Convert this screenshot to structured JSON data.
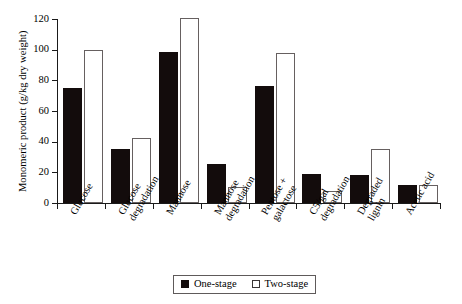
{
  "chart_data": {
    "type": "bar",
    "title": "",
    "xlabel": "",
    "ylabel": "Monomeric product (g/kg dry weight)",
    "ylim": [
      0,
      120
    ],
    "yticks": [
      0,
      20,
      40,
      60,
      80,
      100,
      120
    ],
    "ytick_labels": [
      "0",
      "20",
      "40",
      "60",
      "80",
      "100",
      "120"
    ],
    "grid": false,
    "legend_position": "bottom-center",
    "categories": [
      "Glucose",
      "Glucose degradation",
      "Mannose",
      "Mannose degradation",
      "Pentose + galactose",
      "C5/gal degradation",
      "Degraded lignin",
      "Acetic acid"
    ],
    "category_lines": [
      [
        "Glucose"
      ],
      [
        "Glucose",
        "degradation"
      ],
      [
        "Mannose"
      ],
      [
        "Mannose",
        "degradation"
      ],
      [
        "Pentose +",
        "galactose"
      ],
      [
        "C5/gal",
        "degradation"
      ],
      [
        "Degraded",
        "lignin"
      ],
      [
        "Acetic acid"
      ]
    ],
    "series": [
      {
        "name": "One-stage",
        "color": "#130c0c",
        "values": [
          75,
          35,
          98.5,
          25.5,
          76,
          19,
          18,
          11.5
        ]
      },
      {
        "name": "Two-stage",
        "color": "#ffffff",
        "values": [
          100,
          42.5,
          120.5,
          10.5,
          98,
          8,
          35.5,
          11.5
        ]
      }
    ]
  },
  "legend": {
    "entries": [
      {
        "label": "One-stage",
        "style": "filled"
      },
      {
        "label": "Two-stage",
        "style": "hollow"
      }
    ]
  },
  "colors": {
    "one_stage": "#130c0c",
    "two_stage": "#ffffff",
    "axis": "#1a1a1a",
    "background": "#ffffff"
  }
}
